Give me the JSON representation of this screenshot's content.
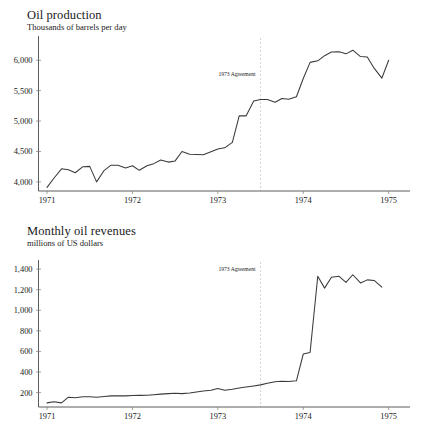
{
  "figures": [
    {
      "id": "oil-production",
      "title": "Oil production",
      "subtitle": "Thousands of barrels per day",
      "annotation": "1973 Agreement"
    },
    {
      "id": "oil-revenues",
      "title": "Monthly oil revenues",
      "subtitle": "millions of US dollars",
      "annotation": "1973 Agreement"
    }
  ],
  "chart_data": [
    {
      "type": "line",
      "title": "Oil production",
      "subtitle": "Thousands of barrels per day",
      "xlabel": "",
      "ylabel": "Thousands of barrels per day",
      "grid": false,
      "legend": "none",
      "xlim": [
        1970.9,
        1975.25
      ],
      "ylim": [
        3850,
        6300
      ],
      "xticks": [
        1971,
        1972,
        1973,
        1974,
        1975
      ],
      "xticklabels": [
        "1971",
        "1972",
        "1973",
        "1974",
        "1975"
      ],
      "yticks": [
        4000,
        4500,
        5000,
        5500,
        6000
      ],
      "yticklabels": [
        "4,000",
        "4,500",
        "5,000",
        "5,500",
        "6,000"
      ],
      "annotations": [
        {
          "text": "1973 Agreement",
          "x": 1973.5,
          "type": "vertical-rule-label"
        }
      ],
      "series": [
        {
          "name": "Oil production",
          "x": [
            1971.0,
            1971.08,
            1971.17,
            1971.25,
            1971.33,
            1971.42,
            1971.5,
            1971.58,
            1971.67,
            1971.75,
            1971.83,
            1971.92,
            1972.0,
            1972.08,
            1972.17,
            1972.25,
            1972.33,
            1972.42,
            1972.5,
            1972.58,
            1972.67,
            1972.75,
            1972.83,
            1972.92,
            1973.0,
            1973.08,
            1973.17,
            1973.25,
            1973.33,
            1973.42,
            1973.5,
            1973.58,
            1973.67,
            1973.75,
            1973.83,
            1973.92,
            1974.0,
            1974.08,
            1974.17,
            1974.25,
            1974.33,
            1974.42,
            1974.5,
            1974.58,
            1974.67,
            1974.75,
            1974.83,
            1974.92,
            1975.0
          ],
          "values": [
            3910,
            4060,
            4215,
            4200,
            4150,
            4250,
            4255,
            4000,
            4190,
            4275,
            4275,
            4230,
            4265,
            4190,
            4265,
            4300,
            4360,
            4325,
            4345,
            4500,
            4455,
            4450,
            4445,
            4495,
            4540,
            4560,
            4650,
            5085,
            5085,
            5330,
            5355,
            5355,
            5310,
            5370,
            5360,
            5400,
            5700,
            5965,
            5990,
            6075,
            6135,
            6140,
            6105,
            6165,
            6060,
            6055,
            5870,
            5705,
            6000
          ]
        }
      ]
    },
    {
      "type": "line",
      "title": "Monthly oil revenues",
      "subtitle": "millions of US dollars",
      "xlabel": "",
      "ylabel": "millions of US dollars",
      "grid": false,
      "legend": "none",
      "xlim": [
        1970.9,
        1975.25
      ],
      "ylim": [
        60,
        1430
      ],
      "xticks": [
        1971,
        1972,
        1973,
        1974,
        1975
      ],
      "xticklabels": [
        "1971",
        "1972",
        "1973",
        "1974",
        "1975"
      ],
      "yticks": [
        200,
        400,
        600,
        800,
        1000,
        1200,
        1400
      ],
      "yticklabels": [
        "200",
        "400",
        "600",
        "800",
        "1,000",
        "1,200",
        "1,400"
      ],
      "annotations": [
        {
          "text": "1973 Agreement",
          "x": 1973.5,
          "type": "vertical-rule-label"
        }
      ],
      "series": [
        {
          "name": "Monthly oil revenues",
          "x": [
            1971.0,
            1971.08,
            1971.17,
            1971.25,
            1971.33,
            1971.42,
            1971.5,
            1971.58,
            1971.67,
            1971.75,
            1971.83,
            1971.92,
            1972.0,
            1972.08,
            1972.17,
            1972.25,
            1972.33,
            1972.42,
            1972.5,
            1972.58,
            1972.67,
            1972.75,
            1972.83,
            1972.92,
            1973.0,
            1973.08,
            1973.17,
            1973.25,
            1973.33,
            1973.42,
            1973.5,
            1973.58,
            1973.67,
            1973.75,
            1973.83,
            1973.92,
            1974.0,
            1974.08,
            1974.17,
            1974.25,
            1974.33,
            1974.42,
            1974.5,
            1974.58,
            1974.67,
            1974.75,
            1974.83,
            1974.92
          ],
          "values": [
            100,
            112,
            100,
            155,
            150,
            160,
            160,
            155,
            162,
            168,
            170,
            168,
            172,
            173,
            175,
            180,
            185,
            190,
            193,
            190,
            196,
            205,
            215,
            222,
            240,
            222,
            232,
            245,
            255,
            265,
            275,
            290,
            305,
            310,
            308,
            315,
            575,
            590,
            1330,
            1215,
            1320,
            1330,
            1270,
            1345,
            1265,
            1295,
            1290,
            1225
          ]
        }
      ]
    }
  ]
}
